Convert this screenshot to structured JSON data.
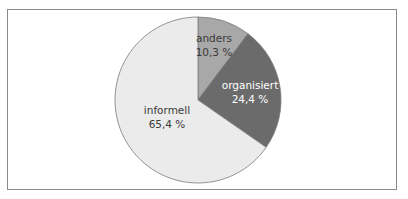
{
  "chart_data": {
    "type": "pie",
    "title": "",
    "slices": [
      {
        "label": "anders",
        "value": 10.3,
        "value_label": "10,3 %",
        "color": "#a8a8a8",
        "text_color": "#3a3a3a"
      },
      {
        "label": "organisiert",
        "value": 24.4,
        "value_label": "24,4 %",
        "color": "#6b6b6b",
        "text_color": "#ffffff"
      },
      {
        "label": "informell",
        "value": 65.4,
        "value_label": "65,4 %",
        "color": "#ebebeb",
        "text_color": "#3a3a3a"
      }
    ],
    "start_angle_deg": 0,
    "direction": "clockwise",
    "legend": "none"
  }
}
